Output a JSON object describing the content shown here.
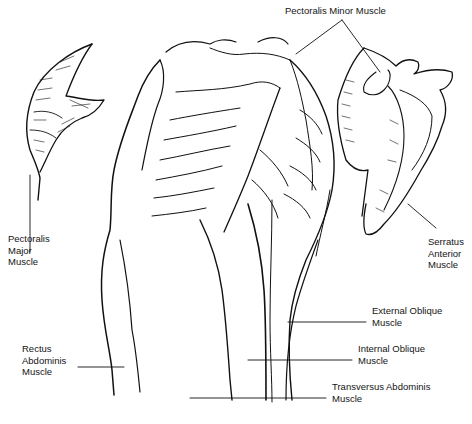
{
  "figure": {
    "labels": {
      "pectoralis_minor": [
        "Pectoralis Minor Muscle"
      ],
      "pectoralis_major": [
        "Pectoralis",
        "Major",
        "Muscle"
      ],
      "serratus_anterior": [
        "Serratus",
        "Anterior",
        "Muscle"
      ],
      "external_oblique": [
        "External Oblique",
        "Muscle"
      ],
      "rectus_abdominis": [
        "Rectus",
        "Abdominis",
        "Muscle"
      ],
      "internal_oblique": [
        "Internal Oblique",
        "Muscle"
      ],
      "transversus_abdominis": [
        "Transversus Abdominis",
        "Muscle"
      ]
    },
    "colors": {
      "ink": "#111111",
      "background": "#ffffff"
    }
  }
}
